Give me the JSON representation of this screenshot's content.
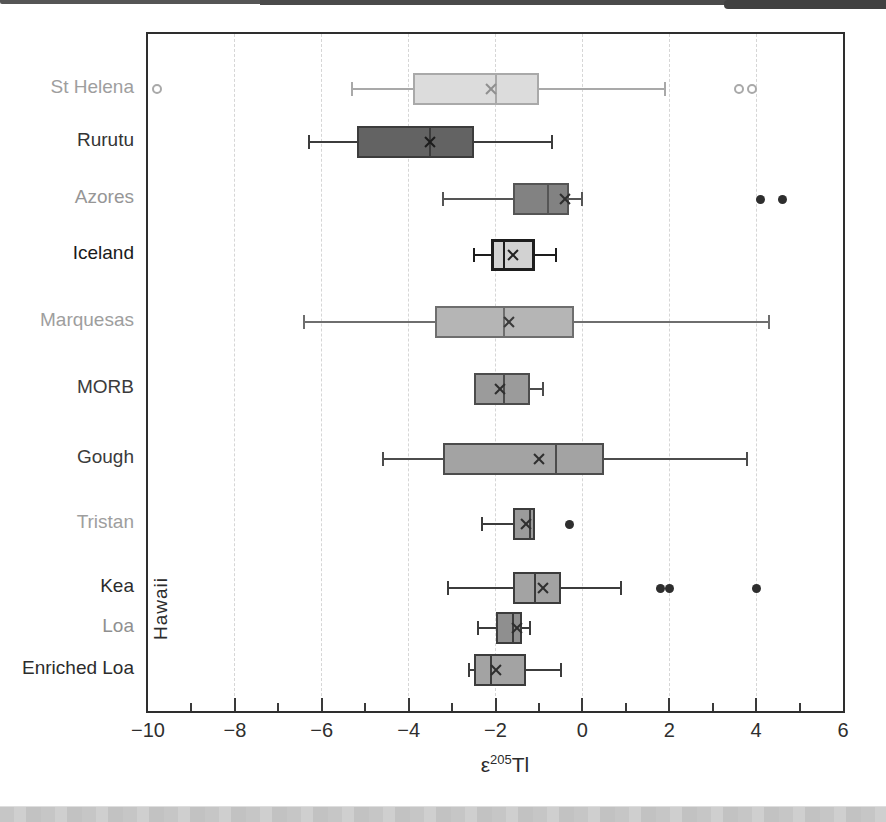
{
  "figure": {
    "kind": "scanned-book-figure",
    "background": "#ffffff",
    "scan_edge_top_color": "#4a4a4a",
    "scan_edge_bottom_color": "#c6c6c6"
  },
  "chart_data": {
    "type": "boxplot",
    "orientation": "horizontal",
    "title": "",
    "xlabel": {
      "prefix": "ε",
      "superscript": "205",
      "suffix": "Tl"
    },
    "xlim": [
      -10,
      6
    ],
    "x_tick_values": [
      -10,
      -8,
      -6,
      -4,
      -2,
      0,
      2,
      4,
      6
    ],
    "x_tick_labels": [
      "−10",
      "−8",
      "−6",
      "−4",
      "−2",
      "0",
      "2",
      "4",
      "6"
    ],
    "minor_tick_values": [
      -9,
      -7,
      -5,
      -3,
      -1,
      1,
      3,
      5
    ],
    "gridline_values": [
      -8,
      -6,
      -4,
      -2,
      0,
      2,
      4
    ],
    "grid": "vertical-dashed",
    "group_label": "Hawaii",
    "group_members": [
      "Kea",
      "Loa",
      "Enriched Loa"
    ],
    "series": [
      {
        "label": "St Helena",
        "whisker_low": -5.3,
        "q1": -3.9,
        "median": -2.0,
        "mean": -2.1,
        "q3": -1.0,
        "whisker_high": 1.9,
        "outliers": [
          -9.8,
          3.6,
          3.9
        ],
        "outlier_style": "open",
        "fill": "#dcdcdc",
        "border": "#a9a9a9",
        "label_color": "#9e9e9e",
        "mean_color": "#8f8f8f",
        "border_width": 2
      },
      {
        "label": "Rurutu",
        "whisker_low": -6.3,
        "q1": -5.2,
        "median": -3.5,
        "mean": -3.5,
        "q3": -2.5,
        "whisker_high": -0.7,
        "outliers": [],
        "outlier_style": "filled",
        "fill": "#636363",
        "border": "#3c3c3c",
        "label_color": "#343434",
        "mean_color": "#1c1c1c",
        "border_width": 2
      },
      {
        "label": "Azores",
        "whisker_low": -3.2,
        "q1": -1.6,
        "median": -0.8,
        "mean": -0.4,
        "q3": -0.3,
        "whisker_high": 0.0,
        "outliers": [
          4.1,
          4.6
        ],
        "outlier_style": "filled",
        "fill": "#828282",
        "border": "#555555",
        "label_color": "#969696",
        "mean_color": "#2e2e2e",
        "border_width": 2
      },
      {
        "label": "Iceland",
        "whisker_low": -2.5,
        "q1": -2.1,
        "median": -1.8,
        "mean": -1.6,
        "q3": -1.1,
        "whisker_high": -0.6,
        "outliers": [],
        "outlier_style": "filled",
        "fill": "#d2d2d2",
        "border": "#1d1d1d",
        "label_color": "#1a1a1a",
        "mean_color": "#222222",
        "border_width": 3
      },
      {
        "label": "Marquesas",
        "whisker_low": -6.4,
        "q1": -3.4,
        "median": -1.8,
        "mean": -1.7,
        "q3": -0.2,
        "whisker_high": 4.3,
        "outliers": [],
        "outlier_style": "filled",
        "fill": "#b5b5b5",
        "border": "#6e6e6e",
        "label_color": "#9e9e9e",
        "mean_color": "#3a3a3a",
        "border_width": 2
      },
      {
        "label": "MORB",
        "whisker_low": null,
        "q1": -2.5,
        "median": -1.8,
        "mean": -1.9,
        "q3": -1.2,
        "whisker_high": -0.9,
        "outliers": [],
        "outlier_style": "filled",
        "fill": "#9b9b9b",
        "border": "#4c4c4c",
        "label_color": "#3b3b3b",
        "mean_color": "#2e2e2e",
        "border_width": 2
      },
      {
        "label": "Gough",
        "whisker_low": -4.6,
        "q1": -3.2,
        "median": -0.6,
        "mean": -1.0,
        "q3": 0.5,
        "whisker_high": 3.8,
        "outliers": [],
        "outlier_style": "filled",
        "fill": "#a3a3a3",
        "border": "#4c4c4c",
        "label_color": "#3b3b3b",
        "mean_color": "#2e2e2e",
        "border_width": 2
      },
      {
        "label": "Tristan",
        "whisker_low": -2.3,
        "q1": -1.6,
        "median": -1.2,
        "mean": -1.3,
        "q3": -1.1,
        "whisker_high": null,
        "outliers": [
          -0.3
        ],
        "outlier_style": "filled",
        "fill": "#9b9b9b",
        "border": "#3c3c3c",
        "label_color": "#9e9e9e",
        "mean_color": "#2e2e2e",
        "border_width": 2
      },
      {
        "label": "Kea",
        "group": "Hawaii",
        "whisker_low": -3.1,
        "q1": -1.6,
        "median": -1.1,
        "mean": -0.9,
        "q3": -0.5,
        "whisker_high": 0.9,
        "outliers": [
          1.8,
          2.0,
          4.0
        ],
        "outlier_style": "filled",
        "fill": "#a3a3a3",
        "border": "#3c3c3c",
        "label_color": "#2c2c2c",
        "mean_color": "#2e2e2e",
        "border_width": 2
      },
      {
        "label": "Loa",
        "group": "Hawaii",
        "whisker_low": -2.4,
        "q1": -2.0,
        "median": -1.6,
        "mean": -1.5,
        "q3": -1.4,
        "whisker_high": -1.2,
        "outliers": [],
        "outlier_style": "filled",
        "fill": "#8f8f8f",
        "border": "#3c3c3c",
        "label_color": "#8f8f8f",
        "mean_color": "#2e2e2e",
        "border_width": 2
      },
      {
        "label": "Enriched Loa",
        "group": "Hawaii",
        "whisker_low": -2.6,
        "q1": -2.5,
        "median": -2.1,
        "mean": -2.0,
        "q3": -1.3,
        "whisker_high": -0.5,
        "outliers": [],
        "outlier_style": "filled",
        "fill": "#a3a3a3",
        "border": "#3c3c3c",
        "label_color": "#2c2c2c",
        "mean_color": "#2e2e2e",
        "border_width": 2
      }
    ],
    "layout": {
      "plot": {
        "left": 146,
        "top": 32,
        "width": 699,
        "height": 681
      },
      "row_centers": [
        55,
        108,
        165,
        221,
        288,
        355,
        425,
        490,
        554,
        594,
        636
      ],
      "box_height": 32,
      "legend": "none"
    }
  }
}
